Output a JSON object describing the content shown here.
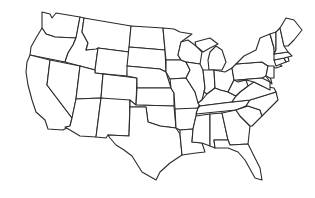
{
  "map": {
    "type": "blank-outline",
    "region": "contiguous-united-states",
    "background": "#ffffff",
    "stroke": "#2b2b2b",
    "fill": "#ffffff",
    "states": [
      {
        "id": "WA",
        "points": "42,12 50,14 52,18 56,13 80,17 76,38 55,37 46,34 42,28"
      },
      {
        "id": "OR",
        "points": "42,28 46,34 55,37 76,38 73,45 68,53 65,62 30,55 31,47 36,38"
      },
      {
        "id": "CA",
        "points": "30,55 50,60 47,85 72,118 70,126 63,130 48,129 45,120 36,112 32,100 28,85 26,72 27,62"
      },
      {
        "id": "ID",
        "points": "80,17 84,18 82,32 88,43 86,50 98,48 95,70 65,62 68,53 73,45 76,38"
      },
      {
        "id": "NV",
        "points": "50,60 80,66 76,99 72,118 47,85"
      },
      {
        "id": "MT",
        "points": "84,18 131,26 129,52 98,48 96,49 86,50 88,43 82,32"
      },
      {
        "id": "WY",
        "points": "98,48 129,52 127,76 95,73 95,70"
      },
      {
        "id": "UT",
        "points": "80,66 95,70 95,73 103,74 101,98 76,99"
      },
      {
        "id": "AZ",
        "points": "76,99 101,98 96,137 80,136 65,127 70,126 72,118"
      },
      {
        "id": "CO",
        "points": "103,74 137,78 136,105 101,98"
      },
      {
        "id": "NM",
        "points": "101,98 130,100 129,136 108,135 106,138 96,137"
      },
      {
        "id": "ND",
        "points": "131,26 163,28 165,50 129,47"
      },
      {
        "id": "SD",
        "points": "129,47 165,50 166,72 160,69 127,66"
      },
      {
        "id": "NE",
        "points": "127,66 160,69 166,72 171,88 137,88 137,78 127,76"
      },
      {
        "id": "KS",
        "points": "137,88 171,88 174,93 174,106 136,105"
      },
      {
        "id": "OK",
        "points": "130,100 136,105 174,106 176,128 160,126 148,122 146,107 130,107"
      },
      {
        "id": "TX",
        "points": "130,107 146,107 148,122 160,126 176,128 180,134 182,155 170,163 160,172 156,180 142,172 132,156 124,150 116,145 110,138 108,135 129,136"
      },
      {
        "id": "MN",
        "points": "163,28 174,29 180,32 192,34 181,42 178,55 181,60 166,60 165,50"
      },
      {
        "id": "IA",
        "points": "166,60 181,60 186,62 190,70 186,78 170,79 166,72"
      },
      {
        "id": "MO",
        "points": "170,79 186,78 190,84 195,92 200,103 198,108 195,110 175,109 174,93 171,88"
      },
      {
        "id": "AR",
        "points": "175,109 198,108 196,116 193,129 180,130 176,128"
      },
      {
        "id": "LA",
        "points": "180,130 193,129 192,142 202,143 205,152 196,153 182,155 180,134"
      },
      {
        "id": "WI",
        "points": "181,42 188,40 196,46 202,52 200,64 186,62 181,60 178,55"
      },
      {
        "id": "IL",
        "points": "186,62 200,64 203,70 205,88 202,100 198,103 195,92 190,84 186,78 190,70"
      },
      {
        "id": "MI",
        "points": "195,42 210,38 218,44 210,48 203,52 196,46 M210,52 216,46 222,50 226,62 222,70 209,70 208,60"
      },
      {
        "id": "IN",
        "points": "203,70 214,70 215,88 207,94 204,92 205,88"
      },
      {
        "id": "OH",
        "points": "214,70 225,72 232,68 234,80 228,92 220,90 215,88"
      },
      {
        "id": "KY",
        "points": "198,103 202,100 207,94 215,88 220,90 228,92 236,96 232,102 200,106"
      },
      {
        "id": "TN",
        "points": "198,108 200,106 232,102 250,100 246,106 236,110 196,114"
      },
      {
        "id": "MS",
        "points": "196,116 210,114 210,146 202,143 192,142 193,129"
      },
      {
        "id": "AL",
        "points": "210,114 222,113 228,140 214,140 215,148 210,146"
      },
      {
        "id": "GA",
        "points": "222,113 236,110 240,116 250,126 248,144 230,145 228,140"
      },
      {
        "id": "FL",
        "points": "214,140 228,140 230,145 248,144 252,152 260,168 262,180 255,178 245,160 238,152 228,148 218,148 215,148"
      },
      {
        "id": "SC",
        "points": "236,110 248,106 260,110 262,116 252,126 250,126 240,116"
      },
      {
        "id": "NC",
        "points": "246,106 250,100 276,92 278,100 270,108 262,116 260,110 248,106"
      },
      {
        "id": "VA",
        "points": "232,102 236,96 240,92 248,86 254,82 262,86 274,88 276,92 250,100"
      },
      {
        "id": "WV",
        "points": "228,92 234,80 238,82 246,80 248,86 240,92 236,96"
      },
      {
        "id": "PA",
        "points": "232,68 236,64 262,62 268,66 266,76 262,78 238,80 234,80"
      },
      {
        "id": "NY",
        "points": "236,64 244,56 256,50 260,38 270,34 274,48 276,62 282,66 276,68 268,66 262,62"
      },
      {
        "id": "MD",
        "points": "238,80 262,78 270,82 270,90 262,86 254,82 246,80"
      },
      {
        "id": "DE",
        "points": "266,76 270,76 272,84 270,82"
      },
      {
        "id": "NJ",
        "points": "268,66 274,66 274,78 270,78 266,76"
      },
      {
        "id": "CT",
        "points": "274,60 284,58 286,62 276,66"
      },
      {
        "id": "RI",
        "points": "284,58 288,57 289,61 286,62"
      },
      {
        "id": "MA",
        "points": "274,54 288,52 292,56 288,57 284,58 274,60"
      },
      {
        "id": "VT",
        "points": "270,34 276,32 276,50 274,54 274,48"
      },
      {
        "id": "NH",
        "points": "276,32 280,28 284,46 288,52 274,54 276,50"
      },
      {
        "id": "ME",
        "points": "280,28 286,18 294,20 302,30 294,40 288,46 284,46"
      }
    ]
  }
}
